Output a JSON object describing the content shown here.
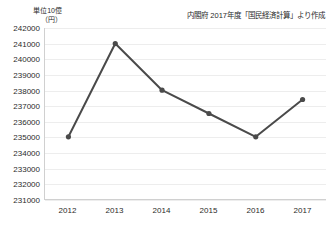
{
  "chart_data": {
    "type": "line",
    "title": "",
    "subtitle": "",
    "source_note": "内閣府 2017年度「国民経済計算」より作成",
    "unit_label": "単位10億\n（円）",
    "xlabel": "",
    "ylabel": "",
    "categories": [
      "2012",
      "2013",
      "2014",
      "2015",
      "2016",
      "2017"
    ],
    "values": [
      235000,
      241000,
      238000,
      236500,
      235000,
      237400
    ],
    "series": [
      {
        "name": "国内総生産",
        "values": [
          235000,
          241000,
          238000,
          236500,
          235000,
          237400
        ]
      }
    ],
    "ylim": [
      231000,
      242000
    ],
    "ytick_labels": [
      "242000",
      "241000",
      "240000",
      "239000",
      "238000",
      "237000",
      "236000",
      "235000",
      "234000",
      "233000",
      "232000",
      "231000"
    ],
    "yticks": [
      242000,
      241000,
      240000,
      239000,
      238000,
      237000,
      236000,
      235000,
      234000,
      233000,
      232000,
      231000
    ],
    "grid": true,
    "legend": "none",
    "line_color": "#4a4a4a",
    "marker_color": "#4a4a4a",
    "grid_color": "#ededed",
    "axis_color": "#d0d0d0",
    "text_color": "#2b2b2b",
    "background_color": "#ffffff"
  }
}
